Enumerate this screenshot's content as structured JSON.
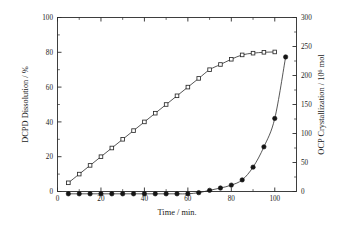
{
  "chart_data": {
    "type": "line",
    "title": "",
    "xlabel": "Time / min.",
    "ylabel": "DCPD Dissolution / %",
    "y2label_main": "OCP Crystallization / 10",
    "y2label_sup": "6",
    "y2label_tail": " mol",
    "xlim": [
      0,
      110
    ],
    "ylim": [
      0,
      100
    ],
    "y2lim": [
      0,
      300
    ],
    "grid": false,
    "legend": "none",
    "xticks": [
      0,
      20,
      40,
      60,
      80,
      100
    ],
    "xticklabels": [
      "0",
      "20",
      "40",
      "60",
      "80",
      "100"
    ],
    "xminor_step": 10,
    "yticks": [
      0,
      20,
      40,
      60,
      80,
      100
    ],
    "yticklabels": [
      "0",
      "20",
      "40",
      "60",
      "80",
      "100"
    ],
    "yminor_step": 10,
    "y2ticks": [
      0,
      50,
      100,
      150,
      200,
      250,
      300
    ],
    "y2ticklabels": [
      "0",
      "50",
      "100",
      "150",
      "200",
      "250",
      "300"
    ],
    "y2minor_step": 25,
    "series": [
      {
        "name": "DCPD Dissolution",
        "axis": "left",
        "marker": "open-square",
        "x": [
          5,
          10,
          15,
          20,
          25,
          30,
          35,
          40,
          45,
          50,
          55,
          60,
          65,
          70,
          75,
          80,
          85,
          90,
          95,
          100
        ],
        "values": [
          5,
          10,
          15,
          20,
          25,
          30,
          35,
          40,
          45,
          50,
          55,
          60,
          65,
          70,
          73,
          76,
          78.5,
          79.5,
          80,
          80.2
        ]
      },
      {
        "name": "OCP Crystallization",
        "axis": "right",
        "marker": "filled-circle",
        "x": [
          5,
          10,
          15,
          20,
          25,
          30,
          35,
          40,
          45,
          50,
          55,
          60,
          65,
          70,
          75,
          80,
          85,
          90,
          95,
          100,
          105
        ],
        "values": [
          -4,
          -4,
          -4,
          -4,
          -4,
          -4,
          -4,
          -4,
          -4,
          -4,
          -4,
          -4,
          -2,
          2,
          6,
          11,
          20,
          42,
          77,
          126,
          232
        ]
      }
    ]
  }
}
